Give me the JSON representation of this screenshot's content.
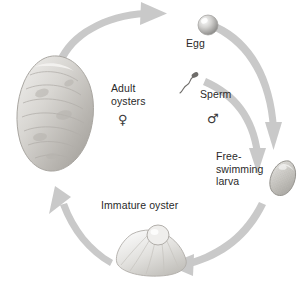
{
  "diagram": {
    "type": "cycle",
    "background_color": "#ffffff",
    "arrow_color": "#c9c9c9",
    "text_color": "#2a2a2a",
    "direction": "clockwise",
    "stages": [
      {
        "id": "adult",
        "label": "Adult\noysters",
        "icon": "adult-oyster-shell-icon"
      },
      {
        "id": "egg",
        "label": "Egg",
        "icon": "egg-sphere-icon"
      },
      {
        "id": "sperm",
        "label": "Sperm",
        "icon": "sperm-cell-icon"
      },
      {
        "id": "larva",
        "label": "Free-\nswimming\nlarva",
        "icon": "free-swimming-larva-icon"
      },
      {
        "id": "immature",
        "label": "Immature oyster",
        "icon": "immature-oyster-shell-icon"
      }
    ],
    "symbols": {
      "female": "♀",
      "male": "♂"
    },
    "arrows": [
      {
        "id": "adult-to-egg",
        "from": "adult",
        "to": "egg"
      },
      {
        "id": "egg-to-larva",
        "from": "egg",
        "to": "larva"
      },
      {
        "id": "sperm-to-larva",
        "from": "sperm",
        "to": "larva"
      },
      {
        "id": "larva-to-immature",
        "from": "larva",
        "to": "immature"
      },
      {
        "id": "immature-to-adult",
        "from": "immature",
        "to": "adult"
      }
    ]
  }
}
